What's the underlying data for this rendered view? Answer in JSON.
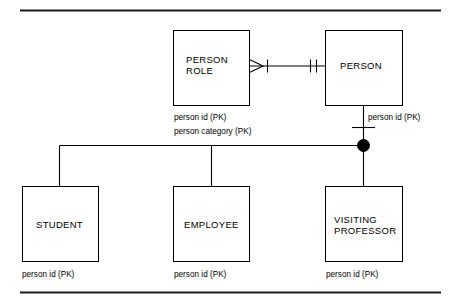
{
  "diagram": {
    "kind": "entity-relationship-diagram",
    "notation": "crows-foot-with-subtype-discriminator",
    "background_color": "#ffffff",
    "line_color": "#000000",
    "rule_color": "#1a1a1a",
    "entities": [
      {
        "id": "person-role",
        "name_line1": "PERSON",
        "name_line2": "ROLE",
        "attributes": [
          "person id (PK)",
          "person category (PK)"
        ]
      },
      {
        "id": "person",
        "name_line1": "PERSON",
        "name_line2": "",
        "attributes": [
          "person id (PK)"
        ]
      },
      {
        "id": "student",
        "name_line1": "STUDENT",
        "name_line2": "",
        "attributes": [
          "person id (PK)"
        ]
      },
      {
        "id": "employee",
        "name_line1": "EMPLOYEE",
        "name_line2": "",
        "attributes": [
          "person id (PK)"
        ]
      },
      {
        "id": "visiting-professor",
        "name_line1": "VISITING",
        "name_line2": "PROFESSOR",
        "attributes": [
          "person id (PK)"
        ]
      }
    ],
    "relationships": [
      {
        "id": "person-role-to-person",
        "from": "person-role",
        "to": "person",
        "from_cardinality": "zero-or-many",
        "to_cardinality": "one-and-only-one"
      },
      {
        "id": "person-subtype-cluster",
        "supertype": "person",
        "subtypes": [
          "student",
          "employee",
          "visiting-professor"
        ],
        "discriminator": "complete-filled-circle"
      }
    ],
    "labels": {
      "person_role_attr_1": "person id (PK)",
      "person_role_attr_2": "person category (PK)",
      "person_attr_1": "person id (PK)",
      "student_attr_1": "person id (PK)",
      "employee_attr_1": "person id (PK)",
      "visiting_professor_attr_1": "person id (PK)",
      "person_role_name_1": "PERSON",
      "person_role_name_2": "ROLE",
      "person_name": "PERSON",
      "student_name": "STUDENT",
      "employee_name": "EMPLOYEE",
      "visiting_professor_name_1": "VISITING",
      "visiting_professor_name_2": "PROFESSOR"
    }
  }
}
